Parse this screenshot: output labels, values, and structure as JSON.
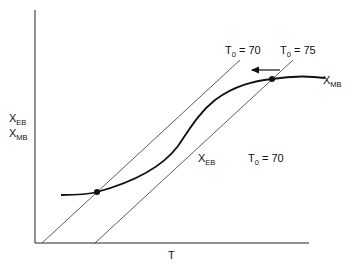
{
  "diagram": {
    "axes": {
      "x_label": "T",
      "y_label_line1": {
        "base": "X",
        "sub": "EB"
      },
      "y_label_line2": {
        "base": "X",
        "sub": "MB"
      }
    },
    "lines": [
      {
        "label": {
          "base": "T",
          "sub": "0",
          "rest": " = 70"
        }
      },
      {
        "label": {
          "base": "T",
          "sub": "0",
          "rest": " = 75"
        }
      }
    ],
    "curve_label": {
      "base": "X",
      "sub": "MB"
    },
    "line_label": {
      "base": "X",
      "sub": "EB"
    },
    "annotation": {
      "base": "T",
      "sub": "0",
      "rest": " = 70"
    },
    "colors": {
      "ink": "#111111",
      "background": "#ffffff"
    }
  }
}
